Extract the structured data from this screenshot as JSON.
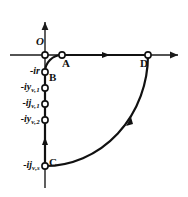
{
  "figure": {
    "type": "complex-plane-locus",
    "axes": {
      "horizontal": {
        "name": "real-axis",
        "arrow": "right"
      },
      "vertical": {
        "name": "imaginary-axis",
        "arrow": "up"
      },
      "origin_label": "O"
    },
    "points": [
      {
        "id": "O",
        "label": "O",
        "x": 45,
        "y": 55
      },
      {
        "id": "A",
        "label": "A",
        "x": 62,
        "y": 55
      },
      {
        "id": "B",
        "label": "B",
        "x": 45,
        "y": 72
      },
      {
        "id": "C",
        "label": "C",
        "x": 45,
        "y": 166
      },
      {
        "id": "D",
        "label": "D",
        "x": 148,
        "y": 55
      }
    ],
    "axis_ticks": [
      {
        "label": "-ir",
        "sub": "",
        "y": 72,
        "marker": "open-circle"
      },
      {
        "label": "-iy",
        "sub": "v,1",
        "y": 88,
        "marker": "open-circle"
      },
      {
        "label": "-ij",
        "sub": "v,1",
        "y": 104,
        "marker": "open-circle"
      },
      {
        "label": "-iy",
        "sub": "v,2",
        "y": 120,
        "marker": "open-circle"
      },
      {
        "label": "-ij",
        "sub": "v,s",
        "y": 166,
        "marker": "open-circle"
      }
    ],
    "direction_markers": [
      {
        "on": "segment-A-D",
        "x": 105,
        "y": 55,
        "direction": "right"
      },
      {
        "on": "segment-B-C",
        "x": 45,
        "y": 140,
        "direction": "down"
      },
      {
        "on": "arc-C-D",
        "x": 128,
        "y": 122,
        "direction": "up"
      }
    ],
    "strokes": {
      "axis": "#1a1a1a",
      "path": "#111111"
    }
  }
}
